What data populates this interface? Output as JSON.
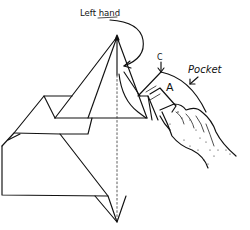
{
  "diagram": {
    "type": "origami-instruction",
    "labels": {
      "left_hand": "Left hand",
      "corner": "C",
      "flap": "A",
      "pocket": "Pocket"
    },
    "colors": {
      "ink": "#111111",
      "paper": "#ffffff"
    }
  }
}
